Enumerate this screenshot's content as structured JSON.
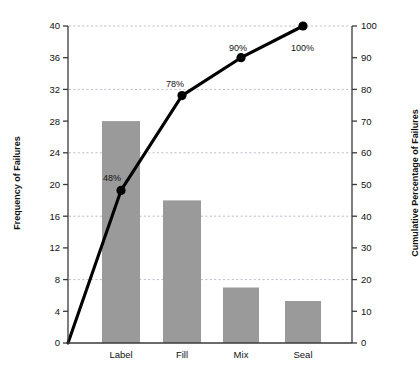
{
  "chart_data": {
    "type": "bar",
    "title": "",
    "subtitle": "",
    "categories": [
      "Label",
      "Fill",
      "Mix",
      "Seal"
    ],
    "values": [
      28.0,
      18.0,
      7.0,
      5.3
    ],
    "xlabel": "",
    "ylabel": "Frequency of Failures",
    "ylim": [
      0,
      40
    ],
    "ytick_labels": [
      "0",
      "4",
      "8",
      "12",
      "16",
      "20",
      "24",
      "28",
      "32",
      "36",
      "40"
    ],
    "ytick_values": [
      0,
      4,
      8,
      12,
      16,
      20,
      24,
      28,
      32,
      36,
      40
    ],
    "grid": true,
    "grid_values": [
      8,
      16,
      24,
      32,
      40
    ],
    "legend": "none",
    "bar_color": "#9a9a9a",
    "line_color": "#000000",
    "axis_color": "#3a3a3a",
    "grid_color": "#b9b9c8",
    "series": [
      {
        "name": "Frequency of Failures",
        "type": "bar",
        "axis": "left",
        "values": [
          28.0,
          18.0,
          7.0,
          5.3
        ]
      },
      {
        "name": "Cumulative Percentage of Failures",
        "type": "line",
        "axis": "right",
        "x_origin": 0,
        "values": [
          48,
          78,
          90,
          100
        ],
        "point_labels": [
          "48%",
          "78%",
          "90%",
          "100%"
        ]
      }
    ],
    "secondary_axis": {
      "ylabel": "Cumulative Percentage of Failures",
      "ylim": [
        0,
        100
      ],
      "ytick_labels": [
        "0",
        "10",
        "20",
        "30",
        "40",
        "50",
        "60",
        "70",
        "80",
        "90",
        "100"
      ],
      "ytick_values": [
        0,
        10,
        20,
        30,
        40,
        50,
        60,
        70,
        80,
        90,
        100
      ]
    }
  },
  "axes": {
    "left_title": "Frequency of Failures",
    "right_title": "Cumulative Percentage of Failures"
  },
  "ticks_left": [
    {
      "label": "40",
      "y": 26
    },
    {
      "label": "36",
      "y": 57.7
    },
    {
      "label": "32",
      "y": 89.4
    },
    {
      "label": "28",
      "y": 121.1
    },
    {
      "label": "24",
      "y": 152.8
    },
    {
      "label": "20",
      "y": 184.5
    },
    {
      "label": "16",
      "y": 216.2
    },
    {
      "label": "12",
      "y": 247.9
    },
    {
      "label": "8",
      "y": 279.6
    },
    {
      "label": "4",
      "y": 311.3
    },
    {
      "label": "0",
      "y": 343
    }
  ],
  "ticks_right": [
    {
      "label": "100",
      "y": 26
    },
    {
      "label": "90",
      "y": 57.7
    },
    {
      "label": "80",
      "y": 89.4
    },
    {
      "label": "70",
      "y": 121.1
    },
    {
      "label": "60",
      "y": 152.8
    },
    {
      "label": "50",
      "y": 184.5
    },
    {
      "label": "40",
      "y": 216.2
    },
    {
      "label": "30",
      "y": 247.9
    },
    {
      "label": "20",
      "y": 279.6
    },
    {
      "label": "10",
      "y": 311.3
    },
    {
      "label": "0",
      "y": 343
    }
  ],
  "gridlines": [
    26,
    89.4,
    152.8,
    216.2,
    279.6
  ],
  "bars": [
    {
      "label": "Label",
      "value": 28.0,
      "x": 102,
      "w": 38,
      "top": 121.1
    },
    {
      "label": "Fill",
      "value": 18.0,
      "x": 163,
      "w": 38,
      "top": 200.4
    },
    {
      "label": "Mix",
      "value": 7.0,
      "x": 223,
      "w": 36,
      "top": 287.5
    },
    {
      "label": "Seal",
      "value": 5.3,
      "x": 285,
      "w": 36,
      "top": 301.0
    }
  ],
  "line_points": [
    {
      "label": "",
      "x": 68,
      "y": 343,
      "marker": false
    },
    {
      "label": "48%",
      "x": 121,
      "y": 190.4,
      "marker": true,
      "lx": 103,
      "ly": 181
    },
    {
      "label": "78%",
      "x": 182,
      "y": 95.6,
      "marker": true,
      "lx": 166,
      "ly": 87
    },
    {
      "label": "90%",
      "x": 241,
      "y": 57.7,
      "marker": true,
      "lx": 229,
      "ly": 51
    },
    {
      "label": "100%",
      "x": 303,
      "y": 26,
      "marker": true,
      "lx": 291,
      "ly": 51
    }
  ]
}
